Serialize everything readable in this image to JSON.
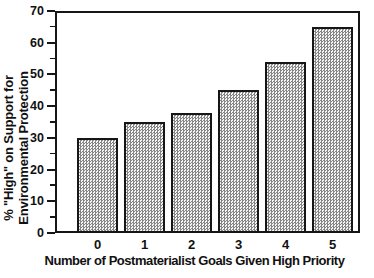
{
  "figure": {
    "ylabel_line1": "% \"High\" on Support for",
    "ylabel_line2": "Environmental Protection",
    "xlabel": "Number of Postmaterialist Goals Given High Priority"
  },
  "chart_data": {
    "type": "bar",
    "categories": [
      "0",
      "1",
      "2",
      "3",
      "4",
      "5"
    ],
    "values": [
      30,
      35,
      38,
      45,
      54,
      65
    ],
    "title": "",
    "xlabel": "Number of Postmaterialist Goals Given High Priority",
    "ylabel": "% \"High\" on Support for Environmental Protection",
    "ylim": [
      0,
      70
    ],
    "yticks": [
      0,
      10,
      20,
      30,
      40,
      50,
      60,
      70
    ],
    "yminor_step": 5,
    "grid": false,
    "legend": null,
    "frame": true,
    "bar_fill_pattern": "gray-checkerboard-hatch",
    "bar_fill_dark": "#868686",
    "bar_fill_light": "#f4f4f4",
    "bar_border_color": "#161616",
    "axis_color": "#161616",
    "text_color": "#111111"
  }
}
